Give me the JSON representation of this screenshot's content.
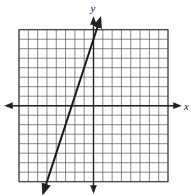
{
  "chart_data": {
    "type": "line",
    "title": "",
    "xlabel": "x",
    "ylabel": "y",
    "xlim": [
      -8,
      8
    ],
    "ylim": [
      -8,
      8
    ],
    "grid": true,
    "grid_step": 1,
    "tick_labels": false,
    "series": [
      {
        "name": "line",
        "equation": "y = 3x + 7",
        "slope": 3,
        "intercept": 7,
        "x": [
          -5,
          -2.33,
          0,
          0.33
        ],
        "y": [
          -8,
          0,
          7,
          8
        ],
        "arrows_both_ends": true
      }
    ]
  },
  "labels": {
    "x_axis": "x",
    "y_axis": "y"
  },
  "colors": {
    "grid": "#555555",
    "axes": "#222222",
    "line": "#1a1a1a",
    "background": "#ffffff"
  }
}
